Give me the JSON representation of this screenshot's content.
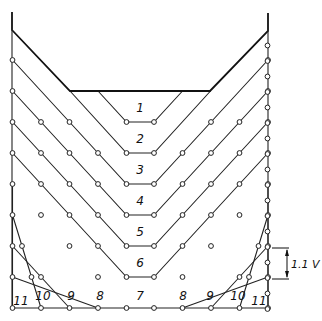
{
  "figure": {
    "region_labels": {
      "center": [
        "1",
        "2",
        "3",
        "4",
        "5",
        "6",
        "7"
      ],
      "bottom_left": [
        "8",
        "9",
        "10",
        "11"
      ],
      "bottom_right": [
        "8",
        "9",
        "10",
        "11"
      ]
    },
    "dimension": {
      "label": "1.1 V"
    },
    "colors": {
      "line": "#111111",
      "background": "#ffffff"
    }
  }
}
